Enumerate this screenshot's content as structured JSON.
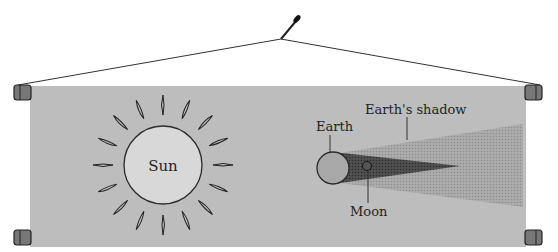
{
  "diagram": {
    "labels": {
      "sun": "Sun",
      "earth": "Earth",
      "earth_shadow": "Earth's shadow",
      "moon": "Moon"
    },
    "colors": {
      "background": "#ffffff",
      "banner": "#bdbdbd",
      "sun_fill": "#d8d8d8",
      "earth_fill": "#a8a8a8",
      "umbra": "#4a4a4a",
      "penumbra": "#a4a4a4",
      "outline": "#2a2a2a"
    }
  }
}
